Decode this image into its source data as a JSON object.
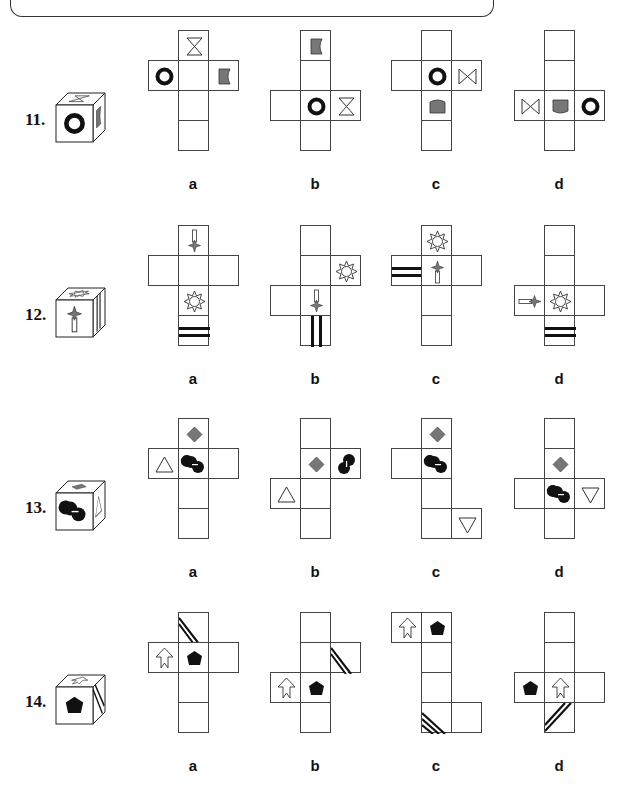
{
  "questions": [
    {
      "number": "11.",
      "options": [
        "a",
        "b",
        "c",
        "d"
      ],
      "cube_faces": {
        "front": "ring",
        "top": "hourglass",
        "right": "gray-cup"
      }
    },
    {
      "number": "12.",
      "options": [
        "a",
        "b",
        "c",
        "d"
      ],
      "cube_faces": {
        "front": "star-arrow",
        "top": "sun",
        "right": "double-stripes"
      }
    },
    {
      "number": "13.",
      "options": [
        "a",
        "b",
        "c",
        "d"
      ],
      "cube_faces": {
        "front": "black-circles",
        "top": "gray-diamond",
        "right": "triangle"
      }
    },
    {
      "number": "14.",
      "options": [
        "a",
        "b",
        "c",
        "d"
      ],
      "cube_faces": {
        "front": "black-pentagon",
        "top": "arrow",
        "right": "diagonal-stripes"
      }
    }
  ],
  "colors": {
    "line": "#444444",
    "gray_fill": "#777777",
    "black": "#111111"
  }
}
